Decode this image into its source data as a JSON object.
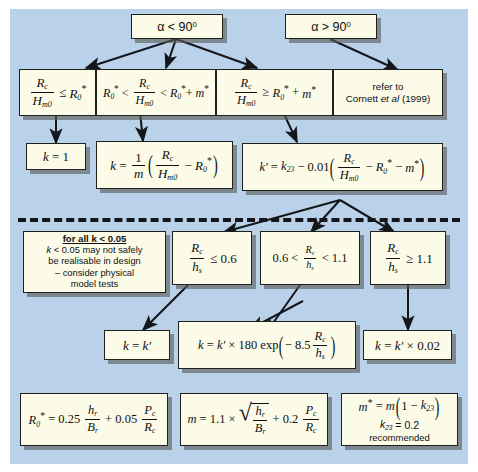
{
  "figure": {
    "type": "decision-flowchart",
    "background_color": "#b9d2ea",
    "box_fill": "#fbfbe8",
    "box_border": "#20211c"
  },
  "nodes": {
    "alpha_lt_90": {
      "text": "α < 90⁰"
    },
    "alpha_gt_90": {
      "text": "α > 90⁰"
    },
    "cond_rc_le_r0": {
      "text": "Rc / Hm0  ≤  R0*"
    },
    "cond_r0_lt_rc_lt": {
      "text": "R0* < Rc / Hm0 < R0* + m*"
    },
    "cond_rc_ge_r0m": {
      "text": "Rc / Hm0  ≥  R0* + m*"
    },
    "refer": {
      "line1": "refer to",
      "line2": "Cornett et al (1999)"
    },
    "k_eq_1": {
      "text": "k = 1"
    },
    "k_eq_frac": {
      "text": "k = (1/m)(Rc/Hm0 − R0*)"
    },
    "kprime": {
      "text": "k' = k23 − 0.01(Rc/Hm0 − R0* − m*)"
    },
    "note_k005": {
      "title": "for all k < 0.05",
      "line1": "k < 0.05 may not safely",
      "line2": "be realisable in design",
      "line3": "– consider physical",
      "line4": "model tests"
    },
    "cond_rc_hs_le": {
      "text": "Rc / hs  ≤  0.6"
    },
    "cond_rc_hs_mid": {
      "text": "0.6 <  Rc / hs  < 1.1"
    },
    "cond_rc_hs_ge": {
      "text": "Rc / hs  ≥  1.1"
    },
    "k_eq_kprime": {
      "text": "k = k'"
    },
    "k_exp": {
      "text": "k = k' × 180 exp(− 8.5 Rc/hs)"
    },
    "k_002": {
      "text": "k = k' × 0.02"
    },
    "formula_r0": {
      "text": "R0* = 0.25 hr/Br + 0.05 Pc/Rc"
    },
    "formula_m": {
      "text": "m = 1.1 × √(hr/Br) + 0.2 Pc/Rc"
    },
    "formula_mstar": {
      "line1": "m* = m(1 − k23)",
      "line2": "k23 = 0.2",
      "line3": "recommended"
    }
  },
  "symbols": {
    "alpha": "α",
    "le": "≤",
    "ge": "≥",
    "lt": "<",
    "gt": ">",
    "minus": "−",
    "times": "×",
    "degree": "0",
    "prime": "'",
    "star": "*",
    "R": "R",
    "H": "H",
    "h": "h",
    "B": "B",
    "P": "P",
    "k": "k",
    "m": "m",
    "c": "c",
    "s": "s",
    "r": "r",
    "m0": "m0",
    "sub0": "0",
    "sub23": "23",
    "exp": "exp",
    "val_0_25": "0.25",
    "val_0_05": "0.05",
    "val_1_1": "1.1",
    "val_0_2": "0.2",
    "val_0_6": "0.6",
    "val_1_1b": "1.1",
    "val_180": "180",
    "val_8_5": "8.5",
    "val_0_01": "0.01",
    "val_0_02": "0.02",
    "val_1": "1",
    "val_90": "90"
  }
}
